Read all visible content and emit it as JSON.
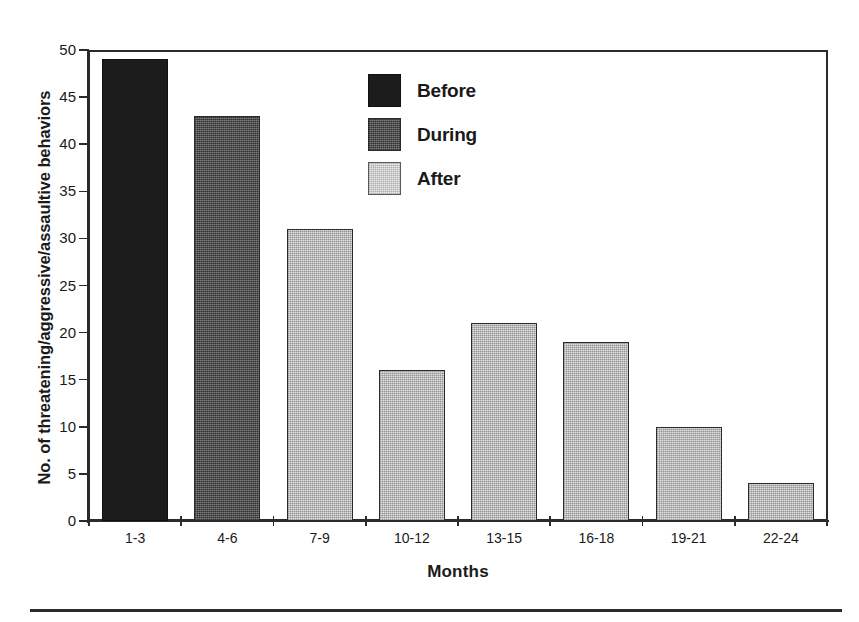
{
  "chart_data": {
    "type": "bar",
    "title": "",
    "xlabel": "Months",
    "ylabel": "No. of threatening/aggressive/assaultive behaviors",
    "categories": [
      "1-3",
      "4-6",
      "7-9",
      "10-12",
      "13-15",
      "16-18",
      "19-21",
      "22-24"
    ],
    "values": [
      49,
      43,
      31,
      16,
      21,
      19,
      10,
      4
    ],
    "bar_phase": [
      "Before",
      "During",
      "After",
      "After",
      "After",
      "After",
      "After",
      "After"
    ],
    "ylim": [
      0,
      50
    ],
    "yticks": [
      0,
      5,
      10,
      15,
      20,
      25,
      30,
      35,
      40,
      45,
      50
    ],
    "ytick_labels": [
      "0",
      "5",
      "10",
      "15",
      "20",
      "25",
      "30",
      "35",
      "40",
      "45",
      "50"
    ],
    "grid": false,
    "legend_position": "upper-center",
    "legend": [
      {
        "label": "Before",
        "swatch": "black",
        "color": "#1c1c1c"
      },
      {
        "label": "During",
        "swatch": "dark-gray-dither",
        "color": "#5a5a5a"
      },
      {
        "label": "After",
        "swatch": "light-gray-dither",
        "color": "#e2e2e2"
      }
    ]
  }
}
